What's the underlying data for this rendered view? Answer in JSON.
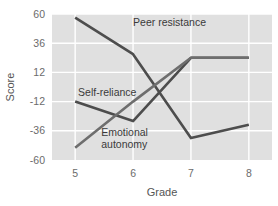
{
  "chart_data": {
    "type": "line",
    "title": "",
    "xlabel": "Grade",
    "ylabel": "Score",
    "x": [
      5,
      6,
      7,
      8
    ],
    "xtick_labels": [
      "5",
      "6",
      "7",
      "8"
    ],
    "ytick_labels": [
      "60",
      "36",
      "12",
      "-12",
      "-36",
      "-60"
    ],
    "ytick_values": [
      60,
      36,
      12,
      -12,
      -36,
      -60
    ],
    "xlim": [
      4.6,
      8.4
    ],
    "ylim": [
      -60,
      60
    ],
    "grid": true,
    "legend": "inline-annotations",
    "plot_background": "#e0e0e0",
    "gridline_color": "#ffffff",
    "series": [
      {
        "name": "Peer resistance",
        "values": [
          57,
          27,
          -42,
          -31
        ],
        "color": "#4d4d4d",
        "label_x": 6.0,
        "label_y": 50
      },
      {
        "name": "Self-reliance",
        "values": [
          -12,
          -28,
          24,
          24
        ],
        "color": "#4d4d4d",
        "label_x": 5.05,
        "label_y": -7
      },
      {
        "name": "Emotional autonomy",
        "values": [
          -50,
          -12,
          24,
          24
        ],
        "color": "#6e6e6e",
        "label_x": 5.45,
        "label_y": -40
      }
    ]
  }
}
